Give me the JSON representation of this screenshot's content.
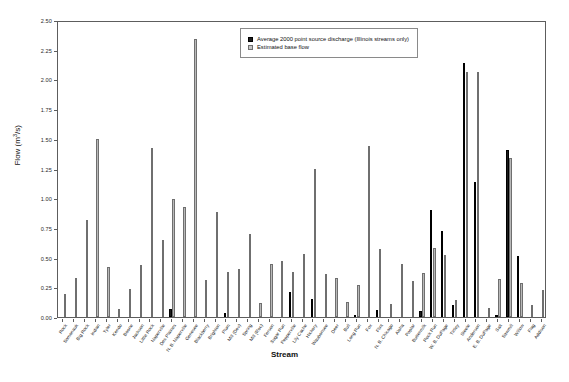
{
  "chart_data": {
    "type": "bar",
    "title": "",
    "xlabel": "Stream",
    "ylabel": "Flow (m3/s)",
    "ylabel_html": "Flow (m<sup>3</sup>/s)",
    "ylim": [
      0.0,
      2.5
    ],
    "yticks": [
      "0.00",
      "0.25",
      "0.50",
      "0.75",
      "1.00",
      "1.25",
      "1.50",
      "1.75",
      "2.00",
      "2.25",
      "2.50"
    ],
    "ytick_values": [
      0.0,
      0.25,
      0.5,
      0.75,
      1.0,
      1.25,
      1.5,
      1.75,
      2.0,
      2.25,
      2.5
    ],
    "grid": false,
    "legend_position": "top-center-right",
    "legend": [
      {
        "label": "Average 2000 point source discharge (Illinois streams only)",
        "swatch": "dark",
        "color": "#1c1c1c"
      },
      {
        "label": "Estimated base flow",
        "swatch": "light",
        "color": "#b9b9b9"
      }
    ],
    "categories": [
      "Rock",
      "Somonauk",
      "Big Rock",
      "Indian",
      "Tyler",
      "Kendo",
      "Boone",
      "Jackson",
      "Little Rock",
      "Naperville",
      "Des Plaines",
      "N. B. Naperville",
      "Genesee",
      "Blackberry",
      "Brighton",
      "Plum",
      "Mill (Dev)",
      "Spring",
      "Mill (Roc)",
      "Ferson",
      "Sugar Run",
      "Pepperville",
      "Lily Cache",
      "Hickory",
      "Waubonsee",
      "Deer",
      "Bull",
      "Long Run",
      "Fox",
      "Flint",
      "N. B. Chicago",
      "Aloha",
      "Poplar",
      "Buttermilk",
      "Rock Run",
      "W. B. DuPage",
      "Tinley",
      "Steele",
      "Anderson",
      "E. B. DuPage",
      "Salt",
      "Sawmill",
      "Willow",
      "Flag",
      "Addison"
    ],
    "series": [
      {
        "name": "Average 2000 point source discharge (Illinois streams only)",
        "color": "#1c1c1c",
        "values": [
          0.0,
          0.0,
          0.0,
          0.0,
          0.0,
          0.0,
          0.0,
          0.0,
          0.0,
          0.0,
          0.07,
          0.0,
          0.0,
          0.0,
          0.0,
          0.03,
          0.0,
          0.0,
          0.0,
          0.0,
          0.0,
          0.21,
          0.0,
          0.15,
          0.0,
          0.0,
          0.0,
          0.02,
          0.0,
          0.06,
          0.0,
          0.0,
          0.0,
          0.05,
          0.9,
          0.72,
          0.1,
          2.14,
          1.14,
          0.0,
          0.01,
          1.41,
          0.51,
          0.0,
          0.0
        ]
      },
      {
        "name": "Estimated base flow",
        "color": "#b9b9b9",
        "values": [
          0.19,
          0.33,
          0.82,
          1.5,
          0.42,
          0.07,
          0.24,
          0.44,
          1.42,
          0.65,
          0.99,
          0.93,
          2.34,
          0.31,
          0.88,
          0.38,
          0.4,
          0.7,
          0.12,
          0.45,
          0.47,
          0.38,
          0.53,
          1.25,
          0.36,
          0.33,
          0.13,
          0.27,
          1.44,
          0.57,
          0.11,
          0.45,
          0.3,
          0.37,
          0.58,
          0.52,
          0.14,
          2.06,
          2.06,
          0.08,
          0.32,
          1.34,
          0.29,
          0.1,
          0.23
        ]
      }
    ]
  }
}
